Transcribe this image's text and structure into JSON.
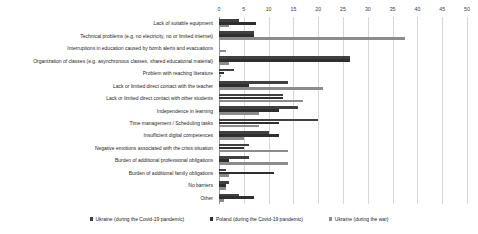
{
  "chart_data": {
    "type": "bar",
    "orientation": "horizontal",
    "title": "",
    "xlabel": "",
    "ylabel": "",
    "xlim": [
      0,
      50
    ],
    "xticks": [
      0,
      5,
      10,
      15,
      20,
      25,
      30,
      35,
      40,
      45,
      50
    ],
    "grid": true,
    "legend_position": "bottom",
    "categories": [
      "Lack of suitable equipment",
      "Technical problems (e.g. no electricity, no or limited internet)",
      "Interruptions in education caused by bomb alerts and evacuations",
      "Organization of classes (e.g. asynchronous classes, shared educational material)",
      "Problem with reaching literature",
      "Lack or limited direct contact with the teacher",
      "Lack or limited direct contact with other students",
      "Independence in learning",
      "Time management / Scheduling tasks",
      "Insufficient digital competences",
      "Negative emotions associated with the crisis situation",
      "Burden of additional professional obligations",
      "Burden of additional family obligations",
      "No barriers",
      "Other"
    ],
    "series": [
      {
        "name": "Ukraine (during the Covid-19 pandemic)",
        "color": "#404040",
        "values": [
          4,
          7,
          0,
          26.5,
          3,
          14,
          13,
          16,
          20,
          10,
          6,
          6,
          1.5,
          2,
          4
        ]
      },
      {
        "name": "Poland (during the Covid-19 pandemic)",
        "color": "#2f2f2f",
        "values": [
          7.5,
          7,
          0,
          26.5,
          1,
          6,
          13,
          12,
          12,
          12,
          5,
          2,
          11,
          1.5,
          7
        ]
      },
      {
        "name": "Ukraine (during the war)",
        "color": "#8c8c8c",
        "values": [
          2,
          37.5,
          1.5,
          2,
          0.5,
          21,
          17,
          8,
          8,
          5,
          14,
          14,
          2,
          1.5,
          1
        ]
      }
    ]
  }
}
